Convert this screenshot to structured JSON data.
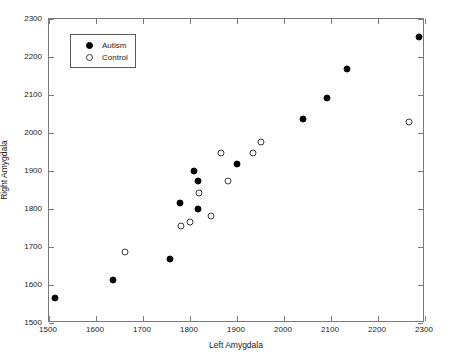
{
  "chart_data": {
    "type": "scatter",
    "title": "",
    "xlabel": "Left Amygdala",
    "ylabel": "Right Amygdala",
    "xlim": [
      1500,
      2300
    ],
    "ylim": [
      1500,
      2300
    ],
    "xticks": [
      1500,
      1600,
      1700,
      1800,
      1900,
      2000,
      2100,
      2200,
      2300
    ],
    "yticks": [
      1500,
      1600,
      1700,
      1800,
      1900,
      2000,
      2100,
      2200,
      2300
    ],
    "grid": false,
    "legend_position": "upper left",
    "series": [
      {
        "name": "Autism",
        "marker": "filled-circle",
        "color": "#000000",
        "points": [
          [
            1512,
            1567
          ],
          [
            1637,
            1613
          ],
          [
            1757,
            1669
          ],
          [
            1779,
            1816
          ],
          [
            1808,
            1899
          ],
          [
            1818,
            1875
          ],
          [
            1816,
            1799
          ],
          [
            1901,
            1918
          ],
          [
            2040,
            2037
          ],
          [
            2092,
            2091
          ],
          [
            2134,
            2168
          ],
          [
            2288,
            2252
          ]
        ]
      },
      {
        "name": "Control",
        "marker": "open-circle",
        "color": "#3a3a3a",
        "points": [
          [
            1662,
            1687
          ],
          [
            1780,
            1754
          ],
          [
            1801,
            1766
          ],
          [
            1819,
            1843
          ],
          [
            1845,
            1781
          ],
          [
            1866,
            1948
          ],
          [
            1881,
            1875
          ],
          [
            1934,
            1948
          ],
          [
            1951,
            1977
          ],
          [
            2267,
            2028
          ]
        ]
      }
    ]
  },
  "legend": {
    "entries": [
      {
        "label": "Autism",
        "marker": "filled-circle"
      },
      {
        "label": "Control",
        "marker": "open-circle"
      }
    ]
  }
}
